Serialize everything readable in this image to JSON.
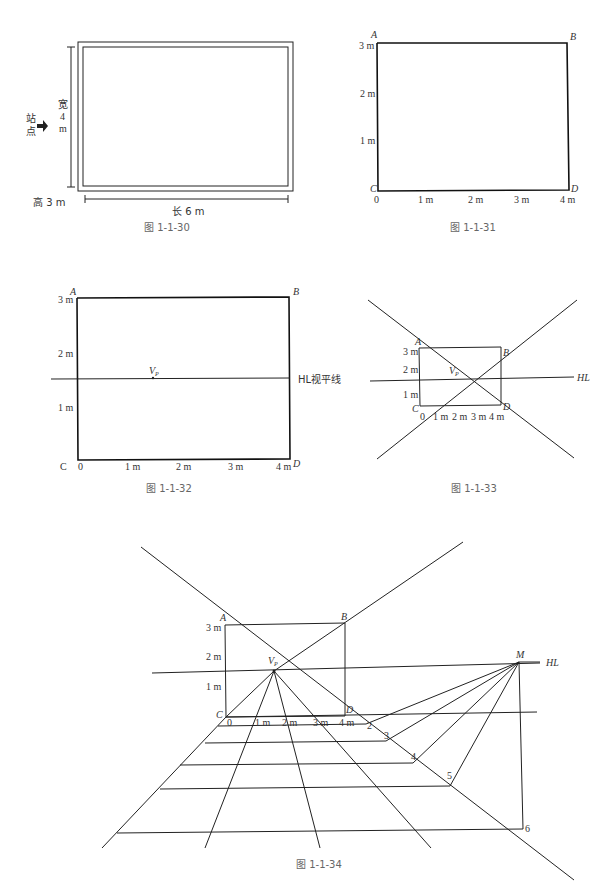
{
  "figures": {
    "fig30": {
      "caption": "图 1-1-30",
      "station_label_1": "站",
      "station_label_2": "点",
      "width_label_1": "宽",
      "width_label_2": "4",
      "width_label_3": "m",
      "height_label": "高 3 m",
      "length_label": "长 6 m"
    },
    "fig31": {
      "caption": "图 1-1-31",
      "corners": {
        "a": "A",
        "b": "B",
        "c": "C",
        "d": "D"
      },
      "y_ticks": [
        "3 m",
        "2 m",
        "1 m"
      ],
      "x_ticks": [
        "0",
        "1 m",
        "2 m",
        "3 m",
        "4 m"
      ]
    },
    "fig32": {
      "caption": "图 1-1-32",
      "corners": {
        "a": "A",
        "b": "B",
        "c": "C",
        "d": "D"
      },
      "y_ticks": [
        "3 m",
        "2 m",
        "1 m"
      ],
      "x_ticks": [
        "0",
        "1 m",
        "2 m",
        "3 m",
        "4 m"
      ],
      "vp_label": "V",
      "vp_sub": "P",
      "hl_label": "HL视平线"
    },
    "fig33": {
      "caption": "图 1-1-33",
      "corners": {
        "a": "A",
        "b": "B",
        "c": "C",
        "d": "D"
      },
      "y_ticks": [
        "3 m",
        "2 m",
        "1 m"
      ],
      "x_ticks": [
        "0",
        "1 m",
        "2 m",
        "3 m",
        "4 m"
      ],
      "vp_label": "V",
      "vp_sub": "P",
      "hl_label": "HL"
    },
    "fig34": {
      "caption": "图 1-1-34",
      "corners": {
        "a": "A",
        "b": "B",
        "c": "C",
        "d": "D"
      },
      "y_ticks": [
        "3 m",
        "2 m",
        "1 m"
      ],
      "x_ticks": [
        "0",
        "1 m",
        "2 m",
        "3 m",
        "4 m"
      ],
      "vp_label": "V",
      "vp_sub": "P",
      "m_label": "M",
      "hl_label": "HL",
      "depth_marks": [
        "2",
        "3",
        "4",
        "5",
        "6"
      ]
    }
  }
}
